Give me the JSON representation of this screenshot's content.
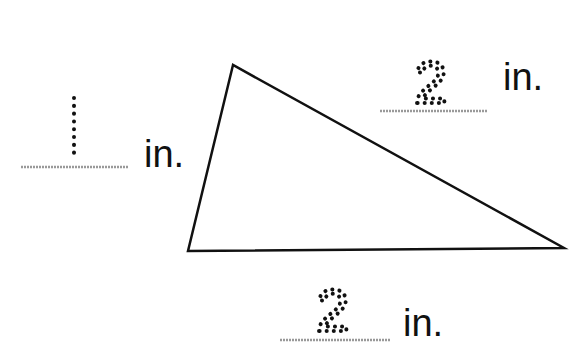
{
  "diagram": {
    "type": "triangle-measurement-worksheet",
    "shape": "triangle",
    "vertices": [
      [
        233,
        65
      ],
      [
        188,
        251
      ],
      [
        564,
        248
      ]
    ],
    "labels": [
      {
        "side": "left",
        "value": "1",
        "unit": "in."
      },
      {
        "side": "top-right",
        "value": "2",
        "unit": "in."
      },
      {
        "side": "bottom",
        "value": "2",
        "unit": "in."
      }
    ],
    "colors": {
      "line": "#111111",
      "answer_line": "#999999",
      "background": "#ffffff"
    }
  }
}
